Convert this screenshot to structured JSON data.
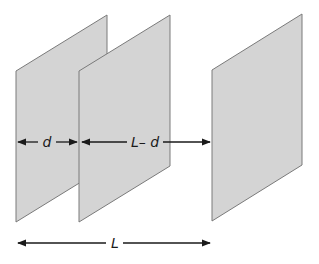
{
  "diagram": {
    "type": "parallel-plates",
    "plates": [
      {
        "id": "plate-1",
        "fill": "#d4d4d4",
        "stroke": "#7a7a7a"
      },
      {
        "id": "plate-2",
        "fill": "#d4d4d4",
        "stroke": "#7a7a7a"
      },
      {
        "id": "plate-3",
        "fill": "#d4d4d4",
        "stroke": "#7a7a7a"
      }
    ],
    "dimensions": {
      "gap_1_label": "d",
      "gap_2_label": "L– d",
      "total_label": "L"
    },
    "arrow_color": "#1a1a1a"
  }
}
